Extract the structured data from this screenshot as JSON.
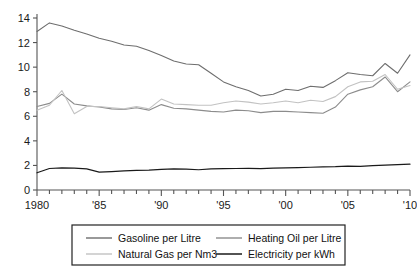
{
  "chart_data": {
    "type": "line",
    "title": "",
    "subtitle": "",
    "xlabel": "",
    "ylabel": "",
    "xlim": [
      1980,
      2010
    ],
    "ylim": [
      0,
      14
    ],
    "grid": false,
    "legend_position": "bottom",
    "y_ticks": [
      0,
      2,
      4,
      6,
      8,
      10,
      12,
      14
    ],
    "y_tick_labels": [
      "0",
      "2",
      "4",
      "6",
      "8",
      "10",
      "12",
      "14"
    ],
    "x_ticks": [
      1980,
      1981,
      1982,
      1983,
      1984,
      1985,
      1986,
      1987,
      1988,
      1989,
      1990,
      1991,
      1992,
      1993,
      1994,
      1995,
      1996,
      1997,
      1998,
      1999,
      2000,
      2001,
      2002,
      2003,
      2004,
      2005,
      2006,
      2007,
      2008,
      2009,
      2010
    ],
    "x_tick_labels": [
      "1980",
      "'85",
      "'90",
      "'95",
      "'00",
      "'05",
      "'10"
    ],
    "x_labeled_ticks": [
      1980,
      1985,
      1990,
      1995,
      2000,
      2005,
      2010
    ],
    "x": [
      1980,
      1981,
      1982,
      1983,
      1984,
      1985,
      1986,
      1987,
      1988,
      1989,
      1990,
      1991,
      1992,
      1993,
      1994,
      1995,
      1996,
      1997,
      1998,
      1999,
      2000,
      2001,
      2002,
      2003,
      2004,
      2005,
      2006,
      2007,
      2008,
      2009,
      2010
    ],
    "series": [
      {
        "name": "Gasoline per Litre",
        "color": "#6e6e6e",
        "width": 1.1,
        "values": [
          12.9,
          13.6,
          13.35,
          13.0,
          12.7,
          12.35,
          12.1,
          11.8,
          11.7,
          11.35,
          10.95,
          10.5,
          10.25,
          10.2,
          9.5,
          8.8,
          8.4,
          8.1,
          7.65,
          7.8,
          8.2,
          8.1,
          8.45,
          8.35,
          8.9,
          9.55,
          9.4,
          9.3,
          10.3,
          9.5,
          11.0
        ]
      },
      {
        "name": "Heating Oil per Litre",
        "color": "#8c8c8c",
        "width": 1.1,
        "values": [
          6.8,
          7.05,
          7.8,
          7.0,
          6.85,
          6.75,
          6.6,
          6.55,
          6.7,
          6.5,
          6.95,
          6.65,
          6.6,
          6.5,
          6.4,
          6.35,
          6.5,
          6.45,
          6.3,
          6.4,
          6.4,
          6.35,
          6.3,
          6.25,
          6.75,
          7.8,
          8.15,
          8.4,
          9.2,
          8.0,
          8.8
        ]
      },
      {
        "name": "Natural Gas per Nm3",
        "color": "#c2c2c2",
        "width": 1.1,
        "values": [
          6.5,
          6.9,
          8.1,
          6.2,
          6.8,
          6.8,
          6.7,
          6.6,
          6.8,
          6.6,
          7.4,
          7.0,
          6.95,
          6.9,
          6.9,
          7.1,
          7.25,
          7.15,
          7.0,
          7.1,
          7.25,
          7.1,
          7.3,
          7.2,
          7.6,
          8.4,
          8.8,
          8.85,
          9.4,
          8.2,
          8.5
        ]
      },
      {
        "name": "Electricity per kWh",
        "color": "#1a1a1a",
        "width": 1.2,
        "values": [
          1.4,
          1.75,
          1.8,
          1.78,
          1.72,
          1.45,
          1.5,
          1.55,
          1.6,
          1.62,
          1.68,
          1.72,
          1.7,
          1.65,
          1.72,
          1.74,
          1.75,
          1.76,
          1.74,
          1.78,
          1.8,
          1.82,
          1.85,
          1.88,
          1.9,
          1.95,
          1.93,
          1.98,
          2.02,
          2.06,
          2.1
        ]
      }
    ]
  },
  "legend": {
    "entries": [
      {
        "label": "Gasoline per Litre"
      },
      {
        "label": "Heating Oil per Litre"
      },
      {
        "label": "Natural Gas per Nm3"
      },
      {
        "label": "Electricity per kWh"
      }
    ]
  },
  "axis": {
    "axis_color": "#555555",
    "legend_border_color": "#222222"
  }
}
